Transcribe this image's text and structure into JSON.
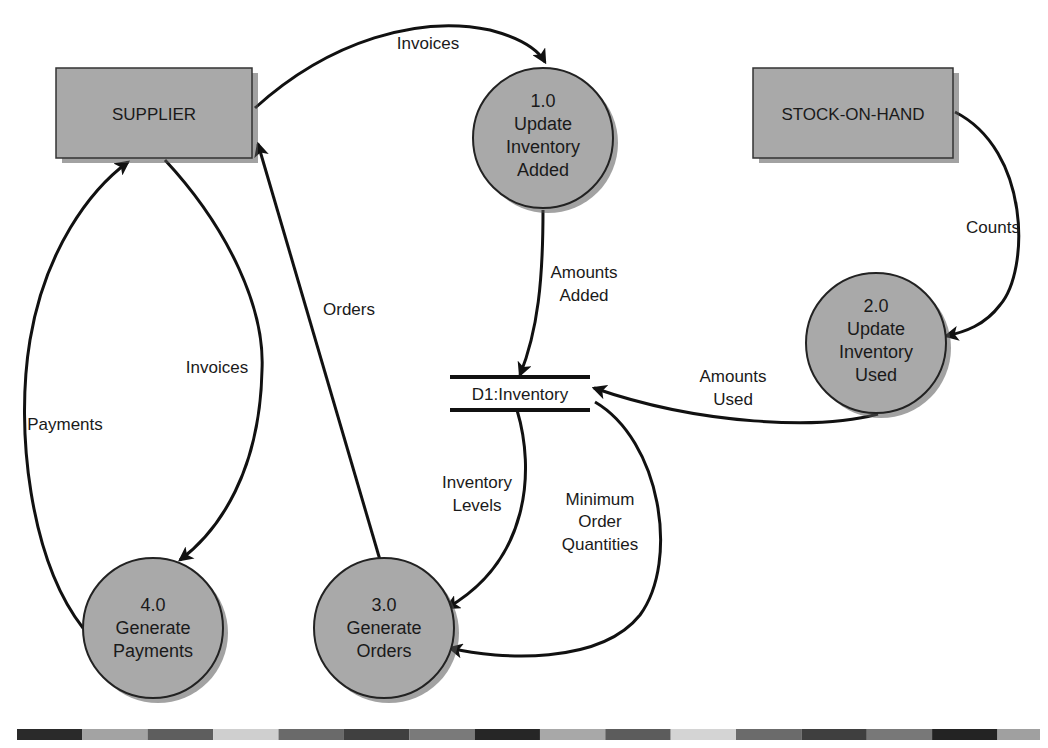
{
  "diagram": {
    "type": "data-flow-diagram",
    "entities": [
      {
        "id": "supplier",
        "label": "SUPPLIER"
      },
      {
        "id": "stock",
        "label": "STOCK-ON-HAND"
      }
    ],
    "processes": [
      {
        "id": "p1",
        "number": "1.0",
        "line1": "Update",
        "line2": "Inventory",
        "line3": "Added"
      },
      {
        "id": "p2",
        "number": "2.0",
        "line1": "Update",
        "line2": "Inventory",
        "line3": "Used"
      },
      {
        "id": "p3",
        "number": "3.0",
        "line1": "Generate",
        "line2": "Orders"
      },
      {
        "id": "p4",
        "number": "4.0",
        "line1": "Generate",
        "line2": "Payments"
      }
    ],
    "data_store": {
      "id": "d1",
      "label": "D1:Inventory"
    },
    "flows": {
      "invoices_top": {
        "label": "Invoices",
        "from": "SUPPLIER",
        "to": "1.0"
      },
      "amounts_added": {
        "line1": "Amounts",
        "line2": "Added",
        "from": "1.0",
        "to": "D1:Inventory"
      },
      "counts": {
        "label": "Counts",
        "from": "STOCK-ON-HAND",
        "to": "2.0"
      },
      "amounts_used": {
        "line1": "Amounts",
        "line2": "Used",
        "from": "2.0",
        "to": "D1:Inventory"
      },
      "inventory_levels": {
        "line1": "Inventory",
        "line2": "Levels",
        "from": "D1:Inventory",
        "to": "3.0"
      },
      "min_order_qty": {
        "line1": "Minimum",
        "line2": "Order",
        "line3": "Quantities",
        "from": "D1:Inventory",
        "to": "3.0"
      },
      "orders": {
        "label": "Orders",
        "from": "3.0",
        "to": "SUPPLIER"
      },
      "invoices_left": {
        "label": "Invoices",
        "from": "SUPPLIER",
        "to": "4.0"
      },
      "payments": {
        "label": "Payments",
        "from": "4.0",
        "to": "SUPPLIER"
      }
    }
  },
  "footer_bar": {
    "colors": [
      "#2a2a2a",
      "#a3a3a3",
      "#5e5e5e",
      "#cfcfcf",
      "#6a6a6a",
      "#404040",
      "#7a7a7a",
      "#262626",
      "#a8a8a8",
      "#5c5c5c",
      "#d4d4d4",
      "#6b6b6b",
      "#3f3f3f",
      "#787878",
      "#232323",
      "#a0a0a0"
    ]
  }
}
